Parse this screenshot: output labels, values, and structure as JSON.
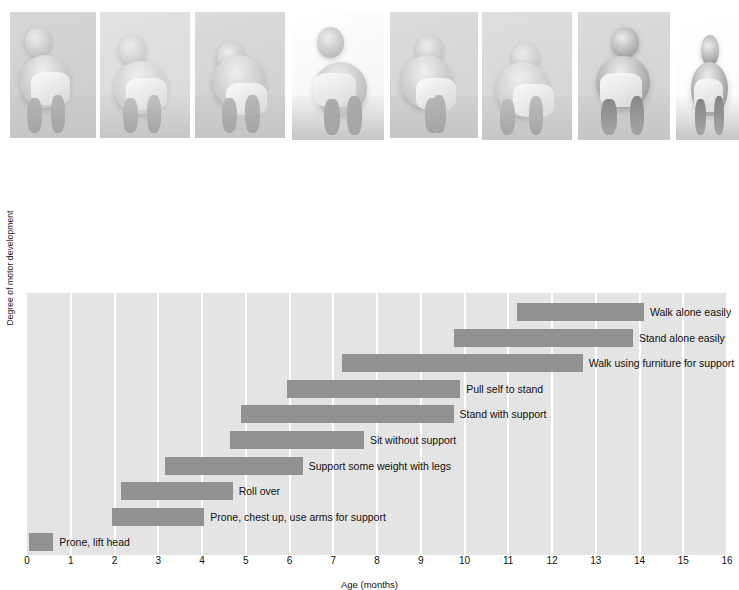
{
  "figure": {
    "y_axis_title": "Degree of motor development",
    "x_axis_title": "Age (months)"
  },
  "photos": [
    {
      "name": "photo-prone-lift-head",
      "alt": "Infant lying prone lifting head"
    },
    {
      "name": "photo-roll-over",
      "alt": "Infant rolling over on bed"
    },
    {
      "name": "photo-support-weight-legs",
      "alt": "Infant bending supporting weight on legs"
    },
    {
      "name": "photo-sit-without-support",
      "alt": "Infant sitting without support"
    },
    {
      "name": "photo-pull-self-to-stand",
      "alt": "Infant pulling self to stand at a box"
    },
    {
      "name": "photo-stand-with-support",
      "alt": "Infant standing holding curtain for support"
    },
    {
      "name": "photo-walk-with-support",
      "alt": "Infant walking while held by adult hands"
    },
    {
      "name": "photo-walk-alone",
      "alt": "Toddler walking alone"
    }
  ],
  "chart_data": {
    "type": "bar",
    "orientation": "horizontal-range",
    "title": "",
    "xlabel": "Age (months)",
    "ylabel": "Degree of motor development",
    "xlim": [
      0,
      16
    ],
    "xticks": [
      "0",
      "1",
      "2",
      "3",
      "4",
      "5",
      "6",
      "7",
      "8",
      "9",
      "10",
      "11",
      "12",
      "13",
      "14",
      "15",
      "16"
    ],
    "grid": "vertical-white-gridlines",
    "legend": "none",
    "bar_color": "#919191",
    "plot_background": "#e4e4e4",
    "gridline_color": "#ffffff",
    "categories": [
      "Walk alone easily",
      "Stand alone easily",
      "Walk using furniture for support",
      "Pull self to stand",
      "Stand with support",
      "Sit without support",
      "Support some weight with legs",
      "Roll over",
      "Prone, chest up, use arms for support",
      "Prone, lift head"
    ],
    "ranges": [
      {
        "label": "Walk alone easily",
        "start": 11.2,
        "end": 14.1
      },
      {
        "label": "Stand alone easily",
        "start": 9.75,
        "end": 13.85
      },
      {
        "label": "Walk using furniture for support",
        "start": 7.2,
        "end": 12.7
      },
      {
        "label": "Pull self to stand",
        "start": 5.95,
        "end": 9.9
      },
      {
        "label": "Stand with support",
        "start": 4.9,
        "end": 9.75
      },
      {
        "label": "Sit without support",
        "start": 4.65,
        "end": 7.7
      },
      {
        "label": "Support some weight with legs",
        "start": 3.15,
        "end": 6.3
      },
      {
        "label": "Roll over",
        "start": 2.15,
        "end": 4.7
      },
      {
        "label": "Prone, chest up, use arms for support",
        "start": 1.95,
        "end": 4.05
      },
      {
        "label": "Prone, lift head",
        "start": 0.05,
        "end": 0.6
      }
    ]
  }
}
